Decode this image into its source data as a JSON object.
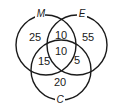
{
  "diagram": {
    "type": "venn",
    "sets": [
      {
        "id": "M",
        "label": "M"
      },
      {
        "id": "E",
        "label": "E"
      },
      {
        "id": "C",
        "label": "C"
      }
    ],
    "regions": {
      "M_only": "25",
      "E_only": "55",
      "C_only": "20",
      "M_E": "10",
      "M_C": "15",
      "E_C": "5",
      "M_E_C": "10"
    }
  }
}
